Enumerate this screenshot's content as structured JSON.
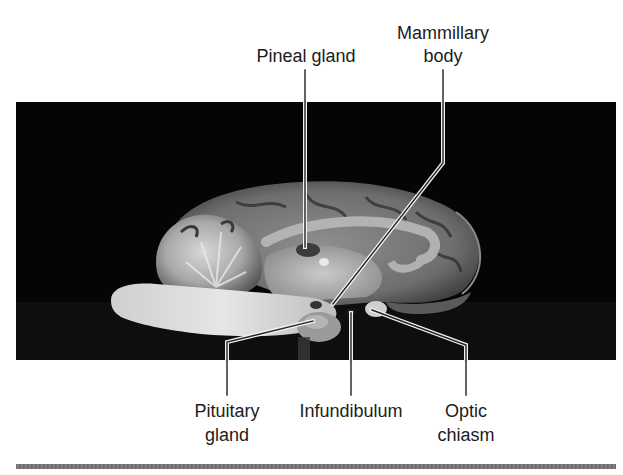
{
  "figure": {
    "labels": {
      "pineal_gland": "Pineal gland",
      "mammillary_body_line1": "Mammillary",
      "mammillary_body_line2": "body",
      "pituitary_gland_line1": "Pituitary",
      "pituitary_gland_line2": "gland",
      "infundibulum": "Infundibulum",
      "optic_chiasm_line1": "Optic",
      "optic_chiasm_line2": "chiasm"
    },
    "colors": {
      "background": "#ffffff",
      "photo_background": "#050505",
      "label_text": "#1c1c1c",
      "leader_line": "#222222",
      "leader_outline": "#f2f2f2",
      "divider": "#707070"
    }
  }
}
